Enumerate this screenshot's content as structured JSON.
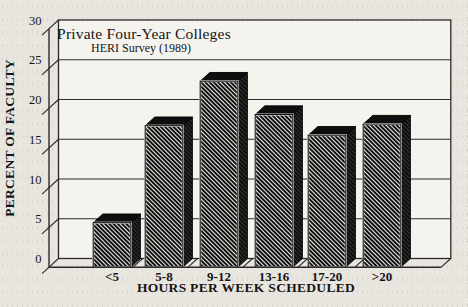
{
  "chart_data": {
    "type": "bar",
    "title": "Private Four-Year Colleges",
    "subtitle": "HERI Survey (1989)",
    "xlabel": "HOURS PER WEEK SCHEDULED",
    "ylabel": "PERCENT OF FACULTY",
    "categories": [
      "<5",
      "5-8",
      "9-12",
      "13-16",
      "17-20",
      ">20"
    ],
    "values": [
      5.6,
      17.8,
      23.4,
      19.2,
      16.6,
      18.0
    ],
    "ylim": [
      0,
      30
    ],
    "yticks": [
      0,
      5,
      10,
      15,
      20,
      25,
      30
    ],
    "grid": true,
    "legend": "none",
    "bar_style": "3d-extruded-diagonal-hatch",
    "colors": {
      "page": "#e9e6df",
      "wall": "#f4f3ee",
      "frame": "#2a2a2a",
      "bar_dark": "#0e0e0e",
      "bar_dark_stripe": "#3a3a3a",
      "hatch_black": "#101010",
      "hatch_line": "#efeee9",
      "text": "#151515"
    }
  }
}
